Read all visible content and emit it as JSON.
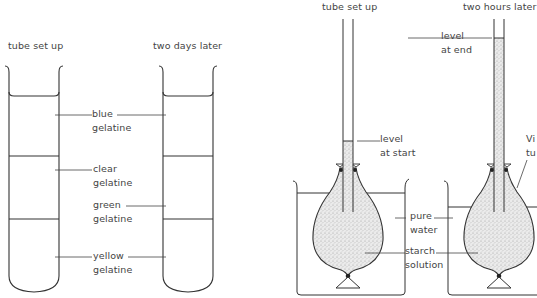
{
  "left_experiment": {
    "caption_setup": "tube set up",
    "caption_later": "two days later",
    "labels": {
      "blue": [
        "blue",
        "gelatine"
      ],
      "clear": [
        "clear",
        "gelatine"
      ],
      "green": [
        "green",
        "gelatine"
      ],
      "yellow": [
        "yellow",
        "gelatine"
      ]
    }
  },
  "right_experiment": {
    "caption_setup": "tube set up",
    "caption_later": "two hours later",
    "labels": {
      "level_start": [
        "level",
        "at start"
      ],
      "level_end": [
        "level",
        "at end"
      ],
      "pure_water": [
        "pure",
        "water"
      ],
      "starch_solution": [
        "starch",
        "solution"
      ],
      "visking_tubing_partial": [
        "Vi",
        "tu"
      ]
    }
  },
  "colors": {
    "line": "#333333",
    "stipple": "#c8c8c8",
    "text": "#444444"
  }
}
